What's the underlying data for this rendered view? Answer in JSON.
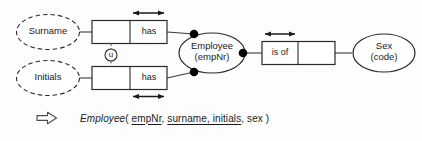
{
  "diagram": {
    "type": "orm-conceptual-schema",
    "value_types": [
      {
        "id": "surname",
        "label": "Surname",
        "border": "dashed"
      },
      {
        "id": "initials",
        "label": "Initials",
        "border": "dashed"
      }
    ],
    "entity_types": [
      {
        "id": "employee",
        "label": "Employee",
        "reference_mode": "(empNr)",
        "border": "solid"
      },
      {
        "id": "sex",
        "label": "Sex",
        "reference_mode": "(code)",
        "border": "solid"
      }
    ],
    "predicates": [
      {
        "id": "surname-has",
        "role_label": "has",
        "cells": [
          "",
          "has"
        ],
        "uniqueness_bar": "above-right-cell"
      },
      {
        "id": "initials-has",
        "role_label": "has",
        "cells": [
          "",
          "has"
        ],
        "uniqueness_bar": "below-right-cell"
      },
      {
        "id": "sex-is-of",
        "role_label": "is of",
        "cells": [
          "is of",
          ""
        ],
        "uniqueness_bar": "above-left-cell"
      }
    ],
    "constraints": [
      {
        "id": "external-uniqueness",
        "marker": "u",
        "style": "circled-letter",
        "connector": "dashed"
      }
    ],
    "mandatory_role_dots": 3
  },
  "schema": {
    "arrow_icon": "hollow-right-arrow",
    "relation_name": "Employee",
    "open_paren": "( ",
    "primary_key": "empNr",
    "separator_1": ", ",
    "alternate_key": "surname, initials",
    "separator_2": ", ",
    "plain_attribute": "sex",
    "close_paren": " )"
  },
  "colors": {
    "stroke": "#1a1a1a",
    "fill": "#ffffff",
    "background": "#fdfdfd",
    "dot": "#000000"
  }
}
